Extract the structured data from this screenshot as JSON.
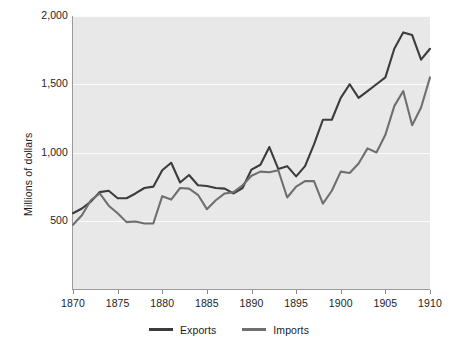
{
  "chart_data": {
    "type": "line",
    "title": "",
    "subtitle": "",
    "xlabel": "",
    "ylabel": "Millions of dollars",
    "xlim": [
      1870,
      1910
    ],
    "ylim": [
      0,
      2000
    ],
    "yticks": [
      500,
      1000,
      1500,
      2000
    ],
    "ytick_labels": [
      "500",
      "1,000",
      "1,500",
      "2,000"
    ],
    "xticks": [
      1870,
      1875,
      1880,
      1885,
      1890,
      1895,
      1900,
      1905,
      1910
    ],
    "xtick_labels": [
      "1870",
      "1875",
      "1880",
      "1885",
      "1890",
      "1895",
      "1900",
      "1905",
      "1910"
    ],
    "grid": true,
    "grid_axis": "y",
    "legend_position": "bottom",
    "plot_background": "#e8e8e8",
    "x": [
      1870,
      1871,
      1872,
      1873,
      1874,
      1875,
      1876,
      1877,
      1878,
      1879,
      1880,
      1881,
      1882,
      1883,
      1884,
      1885,
      1886,
      1887,
      1888,
      1889,
      1890,
      1891,
      1892,
      1893,
      1894,
      1895,
      1896,
      1897,
      1898,
      1899,
      1900,
      1901,
      1902,
      1903,
      1904,
      1905,
      1906,
      1907,
      1908,
      1909,
      1910
    ],
    "series": [
      {
        "name": "Exports",
        "color": "#3c3c3c",
        "values": [
          555,
          590,
          640,
          710,
          720,
          665,
          665,
          700,
          740,
          750,
          870,
          925,
          780,
          835,
          760,
          755,
          740,
          735,
          700,
          740,
          875,
          910,
          1040,
          880,
          900,
          825,
          900,
          1060,
          1240,
          1240,
          1400,
          1500,
          1400,
          1450,
          1500,
          1550,
          1760,
          1880,
          1860,
          1680,
          1760
        ]
      },
      {
        "name": "Imports",
        "color": "#6f6f6f",
        "values": [
          470,
          540,
          650,
          700,
          610,
          555,
          490,
          495,
          480,
          480,
          680,
          655,
          740,
          735,
          690,
          585,
          650,
          700,
          710,
          760,
          830,
          860,
          855,
          870,
          670,
          750,
          790,
          790,
          625,
          720,
          860,
          850,
          920,
          1030,
          1000,
          1130,
          1340,
          1450,
          1200,
          1330,
          1550
        ]
      }
    ]
  },
  "legend": {
    "items": [
      {
        "label": "Exports",
        "color": "#3c3c3c"
      },
      {
        "label": "Imports",
        "color": "#6f6f6f"
      }
    ]
  },
  "axes": {
    "y_title": "Millions of dollars"
  }
}
